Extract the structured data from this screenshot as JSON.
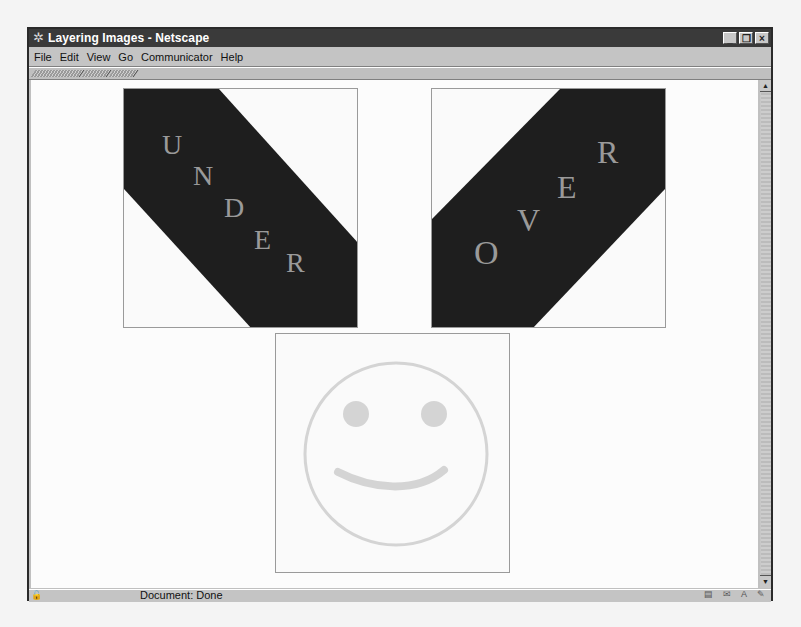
{
  "window": {
    "title": "Layering Images - Netscape",
    "controls": {
      "minimize": "_",
      "restore": "❐",
      "close": "×"
    }
  },
  "menubar": {
    "items": [
      {
        "label": "File",
        "accel": "F"
      },
      {
        "label": "Edit",
        "accel": "E"
      },
      {
        "label": "View",
        "accel": "V"
      },
      {
        "label": "Go",
        "accel": "G"
      },
      {
        "label": "Communicator",
        "accel": "C"
      },
      {
        "label": "Help",
        "accel": "H"
      }
    ]
  },
  "toolbar_tabs": [
    {
      "name": "navigation-toolbar-tab"
    },
    {
      "name": "location-toolbar-tab"
    },
    {
      "name": "personal-toolbar-tab"
    }
  ],
  "page": {
    "images": [
      {
        "name": "under-image",
        "word": "UNDER",
        "letters": [
          "U",
          "N",
          "D",
          "E",
          "R"
        ],
        "band_color": "#1e1e1e",
        "letter_color": "#9a9a9a"
      },
      {
        "name": "over-image",
        "word": "OVER",
        "letters": [
          "O",
          "V",
          "E",
          "R"
        ],
        "band_color": "#1e1e1e",
        "letter_color": "#9a9a9a"
      },
      {
        "name": "smiley-image",
        "face_color": "#d4d4d4"
      }
    ]
  },
  "statusbar": {
    "text": "Document: Done",
    "icons": [
      "component-bar-icon",
      "security-icon",
      "offline-icon",
      "mail-icon"
    ]
  }
}
